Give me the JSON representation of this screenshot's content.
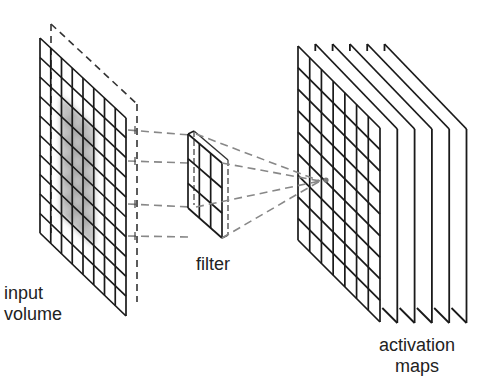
{
  "labels": {
    "input": [
      "input",
      "volume"
    ],
    "filter": "filter",
    "activation": [
      "activation",
      "maps"
    ]
  },
  "colors": {
    "line": "#1a1a1a",
    "dashed": "#555555",
    "highlight": "#8a8a8a",
    "background": "#ffffff"
  },
  "input_volume": {
    "front": {
      "tl": [
        40,
        38
      ],
      "bl": [
        40,
        233
      ],
      "tr": [
        126,
        118
      ],
      "br": [
        126,
        316
      ]
    },
    "back_offset": [
      11,
      -14
    ],
    "cols": 8,
    "rows": 10,
    "highlight": {
      "col_start": 2,
      "col_end": 5,
      "row_start": 2,
      "row_end": 8
    }
  },
  "filter": {
    "front": {
      "tl": [
        188,
        134
      ],
      "bl": [
        188,
        208
      ],
      "tr": [
        222,
        163
      ],
      "br": [
        222,
        238
      ]
    },
    "back_offset": [
      6,
      -3
    ],
    "cols": 3,
    "rows": 3
  },
  "activation_maps": {
    "front": {
      "tl": [
        298,
        46
      ],
      "bl": [
        298,
        240
      ],
      "tr": [
        380,
        128
      ],
      "br": [
        380,
        322
      ]
    },
    "cols": 7,
    "rows": 9,
    "back_planes": 5,
    "plane_step": 17.3,
    "focus_point": [
      320,
      181
    ]
  },
  "connections": {
    "input_to_filter": [
      [
        [
          128,
          130
        ],
        [
          190,
          135
        ]
      ],
      [
        [
          128,
          161
        ],
        [
          190,
          163
        ]
      ],
      [
        [
          128,
          204
        ],
        [
          190,
          207
        ]
      ],
      [
        [
          128,
          236
        ],
        [
          190,
          237
        ]
      ]
    ],
    "filter_to_output": [
      [
        [
          196,
          134
        ],
        [
          320,
          181
        ]
      ],
      [
        [
          222,
          163
        ],
        [
          320,
          181
        ]
      ],
      [
        [
          196,
          207
        ],
        [
          320,
          181
        ]
      ],
      [
        [
          222,
          238
        ],
        [
          320,
          181
        ]
      ]
    ]
  }
}
